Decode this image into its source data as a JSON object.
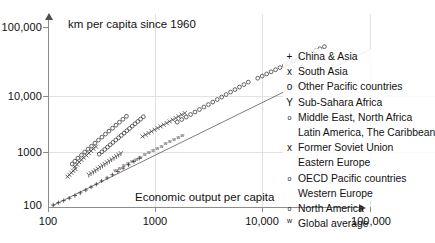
{
  "chart_data": {
    "type": "scatter",
    "title": "km per capita since 1960",
    "xlabel": "Economic output per capita",
    "ylabel": "",
    "xscale": "log",
    "yscale": "log",
    "xlim": [
      100,
      100000
    ],
    "ylim": [
      100,
      100000
    ],
    "xticks": [
      "100",
      "1000",
      "10,000",
      "100,000"
    ],
    "xtick_values": [
      100,
      1000,
      10000,
      100000
    ],
    "yticks": [
      "100",
      "1000",
      "10,000",
      "100,000"
    ],
    "ytick_values": [
      100,
      1000,
      10000,
      100000
    ],
    "grid": true,
    "legend_position": "right",
    "reference_line": {
      "name": "diagonal trend line",
      "from": [
        110,
        105
      ],
      "to": [
        100000,
        42000
      ]
    },
    "series": [
      {
        "name": "China & Asia",
        "marker": "+",
        "points": [
          [
            112,
            108
          ],
          [
            125,
            118
          ],
          [
            140,
            128
          ],
          [
            158,
            140
          ],
          [
            178,
            155
          ],
          [
            200,
            172
          ],
          [
            225,
            192
          ],
          [
            252,
            215
          ],
          [
            282,
            240
          ],
          [
            316,
            272
          ],
          [
            355,
            305
          ],
          [
            398,
            345
          ],
          [
            447,
            392
          ],
          [
            501,
            445
          ],
          [
            562,
            505
          ],
          [
            631,
            575
          ],
          [
            708,
            650
          ]
        ]
      },
      {
        "name": "South Asia",
        "marker": "x",
        "points": [
          [
            152,
            320
          ],
          [
            158,
            345
          ],
          [
            165,
            372
          ],
          [
            172,
            400
          ],
          [
            180,
            430
          ],
          [
            178,
            470
          ],
          [
            186,
            510
          ],
          [
            195,
            560
          ],
          [
            205,
            610
          ],
          [
            215,
            665
          ],
          [
            228,
            725
          ],
          [
            240,
            790
          ],
          [
            252,
            860
          ],
          [
            265,
            935
          ],
          [
            280,
            1015
          ]
        ]
      },
      {
        "name": "Other Pacific countries",
        "marker": "o",
        "points": [
          [
            168,
            520
          ],
          [
            178,
            580
          ],
          [
            190,
            650
          ],
          [
            205,
            730
          ],
          [
            220,
            820
          ],
          [
            236,
            920
          ],
          [
            254,
            1030
          ],
          [
            274,
            1160
          ],
          [
            295,
            1300
          ],
          [
            318,
            1460
          ],
          [
            343,
            1640
          ],
          [
            370,
            1840
          ],
          [
            399,
            2060
          ],
          [
            430,
            2310
          ],
          [
            463,
            2590
          ],
          [
            499,
            2900
          ],
          [
            538,
            3250
          ]
        ]
      },
      {
        "name": "Sub-Sahara Africa",
        "marker": "Y",
        "points": [
          [
            240,
            340
          ],
          [
            252,
            360
          ],
          [
            265,
            382
          ],
          [
            278,
            405
          ],
          [
            292,
            430
          ],
          [
            307,
            456
          ],
          [
            322,
            484
          ],
          [
            338,
            513
          ],
          [
            355,
            545
          ],
          [
            373,
            578
          ],
          [
            392,
            613
          ],
          [
            412,
            650
          ],
          [
            433,
            690
          ],
          [
            455,
            732
          ],
          [
            478,
            776
          ]
        ]
      },
      {
        "name": "Middle East, North Africa / Latin America, The Caribbean",
        "marker": "o",
        "points": [
          [
            300,
            760
          ],
          [
            318,
            830
          ],
          [
            338,
            910
          ],
          [
            358,
            995
          ],
          [
            380,
            1090
          ],
          [
            403,
            1190
          ],
          [
            428,
            1305
          ],
          [
            454,
            1425
          ],
          [
            482,
            1560
          ],
          [
            511,
            1705
          ],
          [
            542,
            1865
          ],
          [
            575,
            2040
          ],
          [
            610,
            2230
          ],
          [
            647,
            2440
          ],
          [
            687,
            2665
          ],
          [
            729,
            2915
          ],
          [
            773,
            3190
          ]
        ]
      },
      {
        "name": "Former Soviet Union / Eastern Europe",
        "marker": "x",
        "points": [
          [
            760,
            1500
          ],
          [
            810,
            1600
          ],
          [
            865,
            1705
          ],
          [
            922,
            1820
          ],
          [
            984,
            1940
          ],
          [
            1050,
            2070
          ],
          [
            1120,
            2205
          ],
          [
            1195,
            2350
          ],
          [
            1275,
            2505
          ],
          [
            1360,
            2670
          ],
          [
            1450,
            2845
          ],
          [
            1547,
            3035
          ],
          [
            1650,
            3235
          ],
          [
            1760,
            3450
          ],
          [
            1878,
            3675
          ]
        ]
      },
      {
        "name": "OECD Pacific countries / Western Europe",
        "marker": "o",
        "points": [
          [
            1600,
            2600
          ],
          [
            1760,
            2870
          ],
          [
            1936,
            3160
          ],
          [
            2130,
            3480
          ],
          [
            2343,
            3830
          ],
          [
            2577,
            4215
          ],
          [
            2835,
            4640
          ],
          [
            3118,
            5105
          ],
          [
            3430,
            5615
          ],
          [
            3773,
            6180
          ],
          [
            4150,
            6800
          ],
          [
            4565,
            7480
          ],
          [
            5022,
            8230
          ],
          [
            5524,
            9055
          ],
          [
            6076,
            9960
          ],
          [
            6684,
            10960
          ],
          [
            7352,
            12060
          ]
        ]
      },
      {
        "name": "North America",
        "marker": "o",
        "points": [
          [
            9000,
            14000
          ],
          [
            9900,
            15200
          ],
          [
            10890,
            16500
          ],
          [
            11979,
            17900
          ],
          [
            13177,
            19400
          ],
          [
            14494,
            21050
          ],
          [
            15944,
            22800
          ],
          [
            17538,
            24700
          ],
          [
            19292,
            26800
          ],
          [
            21221,
            29000
          ],
          [
            23343,
            31450
          ],
          [
            25678,
            34100
          ],
          [
            28245,
            36950
          ],
          [
            31070,
            40000
          ],
          [
            34177,
            43400
          ],
          [
            37595,
            47000
          ]
        ]
      },
      {
        "name": "Global average",
        "marker": "w",
        "points": [
          [
            430,
            420
          ],
          [
            470,
            455
          ],
          [
            515,
            495
          ],
          [
            563,
            538
          ],
          [
            616,
            585
          ],
          [
            674,
            636
          ],
          [
            737,
            692
          ],
          [
            806,
            752
          ],
          [
            882,
            818
          ],
          [
            965,
            890
          ],
          [
            1056,
            968
          ],
          [
            1155,
            1053
          ],
          [
            1264,
            1145
          ],
          [
            1383,
            1245
          ],
          [
            1513,
            1354
          ],
          [
            1655,
            1473
          ],
          [
            1811,
            1602
          ]
        ]
      }
    ],
    "legend_entries": [
      {
        "marker": "+",
        "marker_style": "plus",
        "label": "China & Asia"
      },
      {
        "marker": "x",
        "marker_style": "cross",
        "label": "South Asia"
      },
      {
        "marker": "o",
        "marker_style": "circle",
        "label": "Other Pacific countries"
      },
      {
        "marker": "Y",
        "marker_style": "wye",
        "label": "Sub-Sahara Africa"
      },
      {
        "marker": "o",
        "marker_style": "small-circle",
        "label": "Middle East, North Africa"
      },
      {
        "marker": "",
        "marker_style": "none",
        "label": "Latin America, The Caribbean"
      },
      {
        "marker": "x",
        "marker_style": "cross",
        "label": "Former Soviet Union"
      },
      {
        "marker": "",
        "marker_style": "none",
        "label": "Eastern Europe"
      },
      {
        "marker": "o",
        "marker_style": "small-circle",
        "label": "OECD Pacific countries"
      },
      {
        "marker": "",
        "marker_style": "none",
        "label": "Western Europe"
      },
      {
        "marker": "o",
        "marker_style": "small-circle",
        "label": "North America"
      },
      {
        "marker": "w",
        "marker_style": "superscript",
        "label": "Global average"
      }
    ]
  },
  "colors": {
    "background": "#ffffff",
    "axis": "#8c8c8c",
    "grid": "#e2e2e2",
    "marker": "#333333",
    "text": "#111111"
  }
}
